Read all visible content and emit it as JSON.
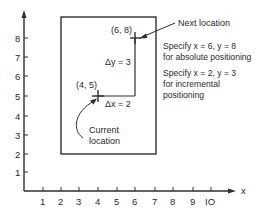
{
  "diagram": {
    "axes": {
      "x_label": "x",
      "x_ticks": [
        "1",
        "2",
        "3",
        "4",
        "5",
        "6",
        "7",
        "8",
        "9",
        "IO"
      ],
      "y_ticks": [
        "1",
        "2",
        "3",
        "4",
        "5",
        "6",
        "7",
        "8"
      ]
    },
    "work_area": {
      "x_from": 2,
      "x_to": 7,
      "y_from": 2,
      "y_to": 9.3
    },
    "current_point": {
      "label": "(4, 5)",
      "x": 4,
      "y": 5
    },
    "next_point": {
      "label": "(6, 8)",
      "x": 6,
      "y": 8
    },
    "delta_x": "Δx = 2",
    "delta_y": "Δy = 3",
    "current_location_label": [
      "Current",
      "location"
    ],
    "next_location_label": "Next location",
    "absolute_note": [
      "Specify x = 6, y = 8",
      "for absolute positioning"
    ],
    "incremental_note": [
      "Specify x = 2, y = 3",
      "for incremental",
      "positioning"
    ],
    "colors": {
      "ink": "#2f2f2f",
      "background": "#ffffff"
    }
  }
}
